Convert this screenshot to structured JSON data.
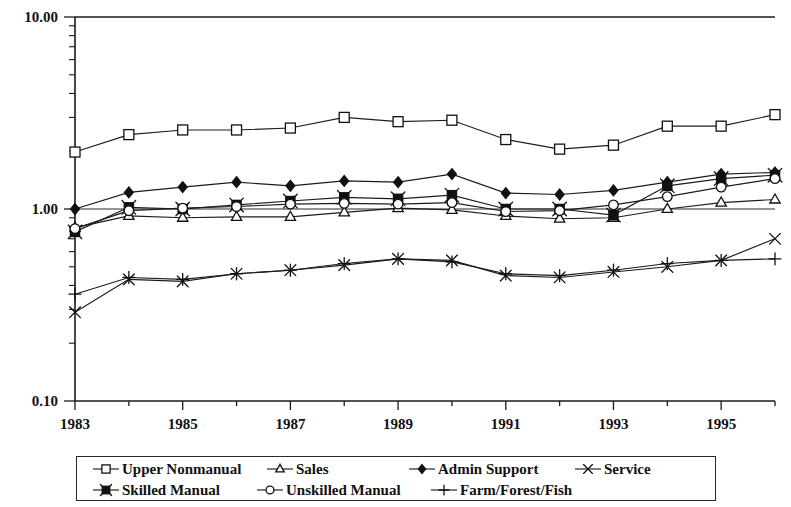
{
  "chart_data": {
    "type": "line",
    "title": "",
    "xlabel": "",
    "ylabel": "",
    "yscale": "log",
    "ylim": [
      0.1,
      10.0
    ],
    "ytick_labels": [
      "10.00",
      "1.00",
      "0.10"
    ],
    "ytick_values": [
      10.0,
      1.0,
      0.1
    ],
    "xtick_labels": [
      "1983",
      "1985",
      "1987",
      "1989",
      "1991",
      "1993",
      "1995"
    ],
    "xtick_values": [
      1983,
      1985,
      1987,
      1989,
      1991,
      1993,
      1995
    ],
    "xlim": [
      1983,
      1996
    ],
    "x": [
      1983,
      1984,
      1985,
      1986,
      1987,
      1988,
      1989,
      1990,
      1991,
      1992,
      1993,
      1994,
      1995,
      1996
    ],
    "grid": false,
    "legend_position": "bottom",
    "series": [
      {
        "name": "Upper Nonmanual",
        "marker": "open-square",
        "values": [
          1.98,
          2.44,
          2.58,
          2.58,
          2.64,
          3.0,
          2.85,
          2.9,
          2.3,
          2.05,
          2.15,
          2.7,
          2.7,
          3.1
        ]
      },
      {
        "name": "Sales",
        "marker": "open-triangle",
        "values": [
          0.8,
          0.92,
          0.9,
          0.91,
          0.91,
          0.96,
          1.01,
          0.99,
          0.92,
          0.89,
          0.9,
          1.0,
          1.08,
          1.12
        ]
      },
      {
        "name": "Admin Support",
        "marker": "solid-diamond",
        "values": [
          1.0,
          1.22,
          1.3,
          1.38,
          1.32,
          1.4,
          1.38,
          1.52,
          1.21,
          1.19,
          1.25,
          1.38,
          1.52,
          1.55
        ]
      },
      {
        "name": "Service",
        "marker": "cross-x",
        "values": [
          0.29,
          0.43,
          0.42,
          0.46,
          0.48,
          0.51,
          0.55,
          0.54,
          0.45,
          0.44,
          0.47,
          0.5,
          0.54,
          0.7
        ]
      },
      {
        "name": "Skilled Manual",
        "marker": "solid-square-x",
        "values": [
          0.76,
          1.02,
          1.0,
          1.05,
          1.1,
          1.15,
          1.13,
          1.18,
          1.0,
          1.0,
          0.93,
          1.32,
          1.44,
          1.5
        ]
      },
      {
        "name": "Unskilled Manual",
        "marker": "open-circle",
        "values": [
          0.79,
          0.98,
          1.01,
          1.03,
          1.06,
          1.07,
          1.06,
          1.08,
          0.97,
          0.98,
          1.05,
          1.16,
          1.3,
          1.44
        ]
      },
      {
        "name": "Farm/Forest/Fish",
        "marker": "plus",
        "values": [
          0.36,
          0.44,
          0.43,
          0.46,
          0.48,
          0.52,
          0.55,
          0.53,
          0.46,
          0.45,
          0.48,
          0.52,
          0.54,
          0.55
        ]
      }
    ]
  },
  "legend": {
    "rows": [
      [
        {
          "label": "Upper Nonmanual",
          "marker": "open-square",
          "left": 14,
          "width": 190
        },
        {
          "label": "Sales",
          "marker": "open-triangle",
          "left": 188,
          "width": 110
        },
        {
          "label": "Admin Support",
          "marker": "solid-diamond",
          "left": 330,
          "width": 180
        },
        {
          "label": "Service",
          "marker": "cross-x",
          "left": 496,
          "width": 130
        }
      ],
      [
        {
          "label": "Skilled Manual",
          "marker": "solid-square-x",
          "left": 14,
          "width": 170
        },
        {
          "label": "Unskilled Manual",
          "marker": "open-circle",
          "left": 178,
          "width": 190
        },
        {
          "label": "Farm/Forest/Fish",
          "marker": "plus",
          "left": 352,
          "width": 190
        }
      ]
    ]
  }
}
